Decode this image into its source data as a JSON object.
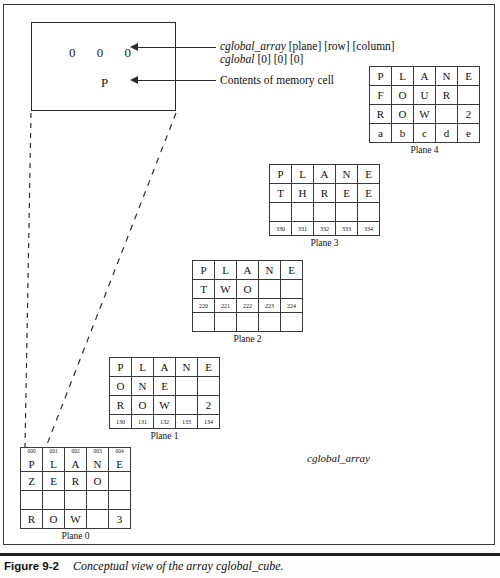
{
  "figure": {
    "caption_number": "Figure  9-2",
    "caption_text": "Conceptual view of the array cglobal_cube.",
    "array_name": "cglobal_array"
  },
  "callout": {
    "index_value": "0   0   0",
    "cell_value": "P",
    "annotations": [
      {
        "name": "subscript-annotation",
        "italic_part": "cglobal_array",
        "plain_part": " [plane] [row] [column]",
        "second_line_italic": "cglobal",
        "second_line_plain": " [0] [0] [0]"
      },
      {
        "name": "contents-annotation",
        "text": "Contents of memory cell"
      }
    ]
  },
  "planes": [
    {
      "id": "plane-0",
      "label": "Plane 0",
      "has_index_row": true,
      "index_row": [
        "000",
        "001",
        "002",
        "003",
        "004"
      ],
      "rows": [
        {
          "type": "letters",
          "cells": [
            "P",
            "L",
            "A",
            "N",
            "E"
          ]
        },
        {
          "type": "letters",
          "cells": [
            "Z",
            "E",
            "R",
            "O",
            ""
          ]
        },
        {
          "type": "letters",
          "cells": [
            "",
            "",
            "",
            "",
            ""
          ]
        },
        {
          "type": "letters",
          "cells": [
            "R",
            "O",
            "W",
            "",
            "3"
          ]
        }
      ]
    },
    {
      "id": "plane-1",
      "label": "Plane  1",
      "has_index_row": false,
      "rows": [
        {
          "type": "letters",
          "cells": [
            "P",
            "L",
            "A",
            "N",
            "E"
          ]
        },
        {
          "type": "letters",
          "cells": [
            "O",
            "N",
            "E",
            "",
            ""
          ]
        },
        {
          "type": "letters",
          "cells": [
            "R",
            "O",
            "W",
            "",
            "2"
          ]
        },
        {
          "type": "numbers",
          "cells": [
            "130",
            "131",
            "132",
            "133",
            "134"
          ]
        }
      ]
    },
    {
      "id": "plane-2",
      "label": "Plane 2",
      "has_index_row": false,
      "rows": [
        {
          "type": "letters",
          "cells": [
            "P",
            "L",
            "A",
            "N",
            "E"
          ]
        },
        {
          "type": "letters",
          "cells": [
            "T",
            "W",
            "O",
            "",
            ""
          ]
        },
        {
          "type": "numbers",
          "cells": [
            "220",
            "221",
            "222",
            "223",
            "224"
          ]
        },
        {
          "type": "letters",
          "cells": [
            "",
            "",
            "",
            "",
            ""
          ]
        }
      ]
    },
    {
      "id": "plane-3",
      "label": "Plane 3",
      "has_index_row": false,
      "rows": [
        {
          "type": "letters",
          "cells": [
            "P",
            "L",
            "A",
            "N",
            "E"
          ]
        },
        {
          "type": "letters",
          "cells": [
            "T",
            "H",
            "R",
            "E",
            "E"
          ]
        },
        {
          "type": "letters",
          "cells": [
            "",
            "",
            "",
            "",
            ""
          ]
        },
        {
          "type": "numbers",
          "cells": [
            "330",
            "331",
            "332",
            "333",
            "334"
          ]
        }
      ]
    },
    {
      "id": "plane-4",
      "label": "Plane 4",
      "has_index_row": false,
      "rows": [
        {
          "type": "letters",
          "cells": [
            "P",
            "L",
            "A",
            "N",
            "E"
          ]
        },
        {
          "type": "letters",
          "cells": [
            "F",
            "O",
            "U",
            "R",
            ""
          ]
        },
        {
          "type": "letters",
          "cells": [
            "R",
            "O",
            "W",
            "",
            "2"
          ]
        },
        {
          "type": "letters",
          "cells": [
            "a",
            "b",
            "c",
            "d",
            "e"
          ]
        }
      ]
    }
  ],
  "colors": {
    "ink": "#111111",
    "rule": "#3a3a3a",
    "page": "#ffffff"
  }
}
